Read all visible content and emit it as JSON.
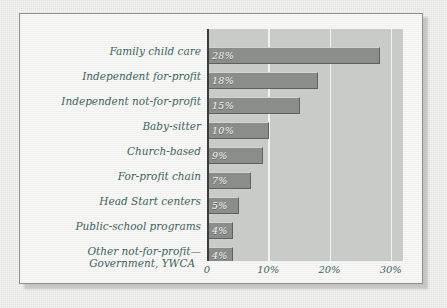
{
  "chart_data": {
    "type": "bar",
    "orientation": "horizontal",
    "title": "",
    "subtitle": "",
    "xlabel": "",
    "ylabel": "",
    "xlim": [
      0,
      32
    ],
    "grid": true,
    "legend": null,
    "xtick_labels": [
      "0",
      "10%",
      "20%",
      "30%"
    ],
    "xtick_values": [
      0,
      10,
      20,
      30
    ],
    "categories": [
      "Family child care",
      "Independent for-profit",
      "Independent not-for-profit",
      "Baby-sitter",
      "Church-based",
      "For-profit chain",
      "Head Start centers",
      "Public-school programs",
      "Other not-for-profit—Government, YWCA"
    ],
    "values": [
      28,
      18,
      15,
      10,
      9,
      7,
      5,
      4,
      4
    ],
    "value_labels": [
      "28%",
      "18%",
      "15%",
      "10%",
      "9%",
      "7%",
      "5%",
      "4%",
      "4%"
    ],
    "bars": [
      {
        "category": "Family child care",
        "label_line1": "Family child care",
        "label_line2": "",
        "value": 28,
        "value_label": "28%"
      },
      {
        "category": "Independent for-profit",
        "label_line1": "Independent for-profit",
        "label_line2": "",
        "value": 18,
        "value_label": "18%"
      },
      {
        "category": "Independent not-for-profit",
        "label_line1": "Independent not-for-profit",
        "label_line2": "",
        "value": 15,
        "value_label": "15%"
      },
      {
        "category": "Baby-sitter",
        "label_line1": "Baby-sitter",
        "label_line2": "",
        "value": 10,
        "value_label": "10%"
      },
      {
        "category": "Church-based",
        "label_line1": "Church-based",
        "label_line2": "",
        "value": 9,
        "value_label": "9%"
      },
      {
        "category": "For-profit chain",
        "label_line1": "For-profit chain",
        "label_line2": "",
        "value": 7,
        "value_label": "7%"
      },
      {
        "category": "Head Start centers",
        "label_line1": "Head Start centers",
        "label_line2": "",
        "value": 5,
        "value_label": "5%"
      },
      {
        "category": "Public-school programs",
        "label_line1": "Public-school programs",
        "label_line2": "",
        "value": 4,
        "value_label": "4%"
      },
      {
        "category": "Other not-for-profit—Government, YWCA",
        "label_line1": "Other not-for-profit—",
        "label_line2": "Government, YWCA",
        "value": 4,
        "value_label": "4%"
      }
    ]
  },
  "colors": {
    "bar_fill": "#8b8d8b",
    "bar_highlight": "#d3d5d2",
    "bar_shadow": "#5f6160",
    "plot_background": "#c9cbc8",
    "gridline": "#f2f3f1",
    "axis_line": "#3b3d3c",
    "label_text": "#3f6360",
    "value_text": "#f4f5f2",
    "card_background": "#f3f4f1",
    "card_border": "#8d8f8c",
    "page_background": "#e7e8e5"
  }
}
